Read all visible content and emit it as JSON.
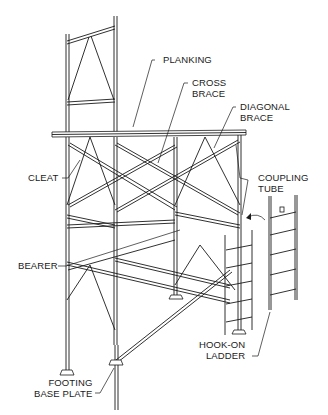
{
  "diagram": {
    "type": "labeled technical illustration",
    "labels": {
      "planking": "PLANKING",
      "cross_brace": "CROSS\nBRACE",
      "diagonal_brace": "DIAGONAL\nBRACE",
      "cleat": "CLEAT",
      "coupling_tube": "COUPLING\nTUBE",
      "bearer": "BEARER",
      "hook_on_ladder": "HOOK-ON\nLADDER",
      "footing_base_plate": "FOOTING\nBASE PLATE"
    },
    "colors": {
      "line": "#1a1a1a",
      "background": "#ffffff"
    }
  }
}
